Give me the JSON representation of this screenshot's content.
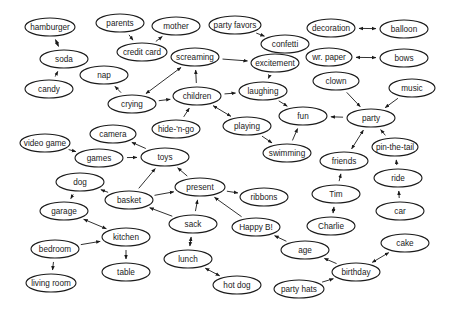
{
  "diagram": {
    "type": "concept-network",
    "nodes": [
      {
        "id": "hamburger",
        "label": "hamburger",
        "x": 50,
        "y": 27,
        "rx": 25
      },
      {
        "id": "parents",
        "label": "parents",
        "x": 120,
        "y": 23,
        "rx": 24
      },
      {
        "id": "mother",
        "label": "mother",
        "x": 176,
        "y": 26,
        "rx": 24
      },
      {
        "id": "party_favors",
        "label": "party favors",
        "x": 235,
        "y": 25,
        "rx": 26
      },
      {
        "id": "decoration",
        "label": "decoration",
        "x": 331,
        "y": 28,
        "rx": 24
      },
      {
        "id": "balloon",
        "label": "balloon",
        "x": 404,
        "y": 29,
        "rx": 24
      },
      {
        "id": "credit_card",
        "label": "credit card",
        "x": 142,
        "y": 52,
        "rx": 25
      },
      {
        "id": "confetti",
        "label": "confetti",
        "x": 285,
        "y": 44,
        "rx": 24
      },
      {
        "id": "soda",
        "label": "soda",
        "x": 64,
        "y": 59,
        "rx": 24
      },
      {
        "id": "wr_paper",
        "label": "wr. paper",
        "x": 329,
        "y": 57,
        "rx": 23
      },
      {
        "id": "bows",
        "label": "bows",
        "x": 404,
        "y": 58,
        "rx": 24
      },
      {
        "id": "screaming",
        "label": "screaming",
        "x": 195,
        "y": 57,
        "rx": 24
      },
      {
        "id": "excitement",
        "label": "excitement",
        "x": 275,
        "y": 63,
        "rx": 24
      },
      {
        "id": "nap",
        "label": "nap",
        "x": 104,
        "y": 75,
        "rx": 24
      },
      {
        "id": "candy",
        "label": "candy",
        "x": 49,
        "y": 89,
        "rx": 24
      },
      {
        "id": "clown",
        "label": "clown",
        "x": 336,
        "y": 81,
        "rx": 23
      },
      {
        "id": "music",
        "label": "music",
        "x": 412,
        "y": 88,
        "rx": 23
      },
      {
        "id": "laughing",
        "label": "laughing",
        "x": 263,
        "y": 91,
        "rx": 24
      },
      {
        "id": "crying",
        "label": "crying",
        "x": 132,
        "y": 104,
        "rx": 24
      },
      {
        "id": "children",
        "label": "children",
        "x": 197,
        "y": 96,
        "rx": 24
      },
      {
        "id": "fun",
        "label": "fun",
        "x": 303,
        "y": 116,
        "rx": 24
      },
      {
        "id": "party",
        "label": "party",
        "x": 371,
        "y": 118,
        "rx": 24
      },
      {
        "id": "hide_n_go",
        "label": "hide-'n-go",
        "x": 176,
        "y": 129,
        "rx": 24
      },
      {
        "id": "playing",
        "label": "playing",
        "x": 247,
        "y": 126,
        "rx": 24
      },
      {
        "id": "pin_the_tail",
        "label": "pin-the-tail",
        "x": 395,
        "y": 147,
        "rx": 23
      },
      {
        "id": "camera",
        "label": "camera",
        "x": 113,
        "y": 134,
        "rx": 23
      },
      {
        "id": "swimming",
        "label": "swimming",
        "x": 287,
        "y": 153,
        "rx": 24
      },
      {
        "id": "video_game",
        "label": "video game",
        "x": 45,
        "y": 143,
        "rx": 25
      },
      {
        "id": "games",
        "label": "games",
        "x": 99,
        "y": 158,
        "rx": 24
      },
      {
        "id": "toys",
        "label": "toys",
        "x": 165,
        "y": 157,
        "rx": 24
      },
      {
        "id": "friends",
        "label": "friends",
        "x": 344,
        "y": 161,
        "rx": 24
      },
      {
        "id": "dog",
        "label": "dog",
        "x": 80,
        "y": 182,
        "rx": 24
      },
      {
        "id": "ride",
        "label": "ride",
        "x": 398,
        "y": 178,
        "rx": 24
      },
      {
        "id": "present",
        "label": "present",
        "x": 200,
        "y": 187,
        "rx": 25
      },
      {
        "id": "basket",
        "label": "basket",
        "x": 129,
        "y": 200,
        "rx": 24
      },
      {
        "id": "ribbons",
        "label": "ribbons",
        "x": 264,
        "y": 197,
        "rx": 24
      },
      {
        "id": "tim",
        "label": "Tim",
        "x": 336,
        "y": 194,
        "rx": 24
      },
      {
        "id": "garage",
        "label": "garage",
        "x": 64,
        "y": 211,
        "rx": 24
      },
      {
        "id": "car",
        "label": "car",
        "x": 400,
        "y": 211,
        "rx": 24
      },
      {
        "id": "sack",
        "label": "sack",
        "x": 193,
        "y": 224,
        "rx": 24
      },
      {
        "id": "happy_b",
        "label": "Happy B!",
        "x": 256,
        "y": 227,
        "rx": 24
      },
      {
        "id": "charlie",
        "label": "Charlie",
        "x": 331,
        "y": 226,
        "rx": 24
      },
      {
        "id": "kitchen",
        "label": "kitchen",
        "x": 126,
        "y": 237,
        "rx": 24
      },
      {
        "id": "cake",
        "label": "cake",
        "x": 405,
        "y": 243,
        "rx": 24
      },
      {
        "id": "bedroom",
        "label": "bedroom",
        "x": 55,
        "y": 249,
        "rx": 24
      },
      {
        "id": "age",
        "label": "age",
        "x": 305,
        "y": 250,
        "rx": 24
      },
      {
        "id": "lunch",
        "label": "lunch",
        "x": 188,
        "y": 259,
        "rx": 24
      },
      {
        "id": "table",
        "label": "table",
        "x": 126,
        "y": 272,
        "rx": 24
      },
      {
        "id": "birthday",
        "label": "birthday",
        "x": 356,
        "y": 272,
        "rx": 24
      },
      {
        "id": "living_room",
        "label": "living room",
        "x": 51,
        "y": 283,
        "rx": 25
      },
      {
        "id": "hot_dog",
        "label": "hot dog",
        "x": 237,
        "y": 285,
        "rx": 24
      },
      {
        "id": "party_hats",
        "label": "party hats",
        "x": 299,
        "y": 289,
        "rx": 25
      }
    ],
    "edges": [
      {
        "from": "hamburger",
        "to": "soda",
        "bidirectional": true
      },
      {
        "from": "candy",
        "to": "soda",
        "bidirectional": false
      },
      {
        "from": "parents",
        "to": "credit_card",
        "bidirectional": false
      },
      {
        "from": "credit_card",
        "to": "mother",
        "bidirectional": false
      },
      {
        "from": "party_favors",
        "to": "confetti",
        "bidirectional": false
      },
      {
        "from": "decoration",
        "to": "balloon",
        "bidirectional": true
      },
      {
        "from": "wr_paper",
        "to": "bows",
        "bidirectional": true
      },
      {
        "from": "screaming",
        "to": "excitement",
        "bidirectional": false
      },
      {
        "from": "crying",
        "to": "screaming",
        "bidirectional": true
      },
      {
        "from": "crying",
        "to": "nap",
        "bidirectional": false
      },
      {
        "from": "crying",
        "to": "children",
        "bidirectional": false
      },
      {
        "from": "children",
        "to": "screaming",
        "bidirectional": false
      },
      {
        "from": "excitement",
        "to": "laughing",
        "bidirectional": false
      },
      {
        "from": "children",
        "to": "laughing",
        "bidirectional": false
      },
      {
        "from": "children",
        "to": "playing",
        "bidirectional": true
      },
      {
        "from": "hide_n_go",
        "to": "children",
        "bidirectional": false
      },
      {
        "from": "laughing",
        "to": "fun",
        "bidirectional": false
      },
      {
        "from": "playing",
        "to": "swimming",
        "bidirectional": false
      },
      {
        "from": "swimming",
        "to": "fun",
        "bidirectional": false
      },
      {
        "from": "party",
        "to": "fun",
        "bidirectional": false
      },
      {
        "from": "clown",
        "to": "party",
        "bidirectional": false
      },
      {
        "from": "music",
        "to": "party",
        "bidirectional": false
      },
      {
        "from": "pin_the_tail",
        "to": "party",
        "bidirectional": false
      },
      {
        "from": "friends",
        "to": "party",
        "bidirectional": true
      },
      {
        "from": "tim",
        "to": "friends",
        "bidirectional": false
      },
      {
        "from": "tim",
        "to": "charlie",
        "bidirectional": true
      },
      {
        "from": "ride",
        "to": "pin_the_tail",
        "bidirectional": false
      },
      {
        "from": "car",
        "to": "ride",
        "bidirectional": false
      },
      {
        "from": "video_game",
        "to": "games",
        "bidirectional": false
      },
      {
        "from": "games",
        "to": "toys",
        "bidirectional": false
      },
      {
        "from": "toys",
        "to": "camera",
        "bidirectional": false
      },
      {
        "from": "present",
        "to": "toys",
        "bidirectional": false
      },
      {
        "from": "basket",
        "to": "toys",
        "bidirectional": false
      },
      {
        "from": "basket",
        "to": "dog",
        "bidirectional": false
      },
      {
        "from": "basket",
        "to": "present",
        "bidirectional": false
      },
      {
        "from": "present",
        "to": "ribbons",
        "bidirectional": false
      },
      {
        "from": "sack",
        "to": "present",
        "bidirectional": false
      },
      {
        "from": "sack",
        "to": "basket",
        "bidirectional": false
      },
      {
        "from": "happy_b",
        "to": "present",
        "bidirectional": false
      },
      {
        "from": "sack",
        "to": "lunch",
        "bidirectional": true
      },
      {
        "from": "lunch",
        "to": "hot_dog",
        "bidirectional": true
      },
      {
        "from": "dog",
        "to": "garage",
        "bidirectional": false
      },
      {
        "from": "garage",
        "to": "kitchen",
        "bidirectional": true
      },
      {
        "from": "bedroom",
        "to": "kitchen",
        "bidirectional": false
      },
      {
        "from": "kitchen",
        "to": "table",
        "bidirectional": false
      },
      {
        "from": "bedroom",
        "to": "living_room",
        "bidirectional": false
      },
      {
        "from": "age",
        "to": "happy_b",
        "bidirectional": false
      },
      {
        "from": "birthday",
        "to": "age",
        "bidirectional": false
      },
      {
        "from": "party_hats",
        "to": "birthday",
        "bidirectional": false
      },
      {
        "from": "birthday",
        "to": "cake",
        "bidirectional": true
      }
    ],
    "style": {
      "stroke_color": "#1a1a1a",
      "fill_color": "#ffffff",
      "background": "#ffffff",
      "node_ry": 9
    }
  }
}
